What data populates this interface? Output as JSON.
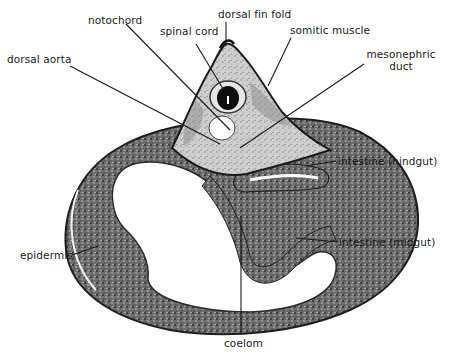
{
  "figure": {
    "type": "labeled micrograph cross-section",
    "labels": [
      {
        "id": "notochord",
        "text": "notochord"
      },
      {
        "id": "spinal-cord",
        "text": "spinal cord"
      },
      {
        "id": "dorsal-fin-fold",
        "text": "dorsal fin fold"
      },
      {
        "id": "somitic-muscle",
        "text": "somitic muscle"
      },
      {
        "id": "dorsal-aorta",
        "text": "dorsal aorta"
      },
      {
        "id": "mesonephric-duct",
        "text": "mesonephric duct",
        "line1": "mesonephric",
        "line2": "duct"
      },
      {
        "id": "intestine-hindgut",
        "text": "intestine (hindgut)"
      },
      {
        "id": "intestine-midgut",
        "text": "intestine (midgut)"
      },
      {
        "id": "epidermis",
        "text": "epidermis"
      },
      {
        "id": "coelom",
        "text": "coelom"
      }
    ],
    "caption": ""
  },
  "colors": {
    "background": "#ffffff",
    "ink": "#1a1a1a",
    "tissue_dark": "#3a3a3a",
    "tissue_mid": "#7a7a7a",
    "tissue_light": "#c8c8c8"
  }
}
